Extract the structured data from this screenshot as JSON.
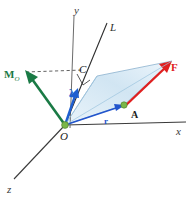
{
  "figure": {
    "background": "#ffffff"
  },
  "colors": {
    "axis": "#3a3a3a",
    "line_L": "#2e2e2e",
    "moment_green": "#1a7a45",
    "force_red": "#e02020",
    "lambda_blue": "#1f5fd0",
    "r_blue": "#2255cc",
    "plane_fill": "#cfe4f2",
    "plane_stroke": "#7fa9c9",
    "point_dot": "#7ab648",
    "dashed": "#3a3a3a"
  },
  "axes": [
    {
      "name": "y-axis",
      "label": "y",
      "label_x": 74,
      "label_y": 5
    },
    {
      "name": "x-axis",
      "label": "x",
      "label_x": 176,
      "label_y": 126
    },
    {
      "name": "z-axis",
      "label": "z",
      "label_x": 7,
      "label_y": 184
    }
  ],
  "lines": [
    {
      "name": "line-L",
      "label": "L",
      "label_x": 110,
      "label_y": 22
    }
  ],
  "points": [
    {
      "name": "origin",
      "label": "O",
      "label_x": 60,
      "label_y": 131,
      "dot_x": 65,
      "dot_y": 125
    },
    {
      "name": "point-A",
      "label": "A",
      "label_x": 131,
      "label_y": 110,
      "dot_x": 124,
      "dot_y": 105
    },
    {
      "name": "point-C",
      "label": "C",
      "label_x": 79,
      "label_y": 64
    }
  ],
  "vectors": [
    {
      "name": "moment-vector-M-O",
      "label": "M",
      "subscript": "O",
      "label_x": 4,
      "label_y": 69,
      "color": "#1a7a45"
    },
    {
      "name": "force-vector-F",
      "label": "F",
      "label_x": 171,
      "label_y": 62,
      "color": "#e02020"
    },
    {
      "name": "unit-vector-lambda",
      "label": "λ",
      "label_x": 69,
      "label_y": 87,
      "color": "#1f5fd0"
    },
    {
      "name": "position-vector-r",
      "label": "r",
      "label_x": 104,
      "label_y": 117,
      "color": "#2255cc"
    }
  ],
  "annotations": {
    "right_angle_marker": "right-angle-at-C",
    "dashed_projection": "dashed-line-from-M-O-to-C",
    "plane_name": "force-plane-parallelogram"
  }
}
